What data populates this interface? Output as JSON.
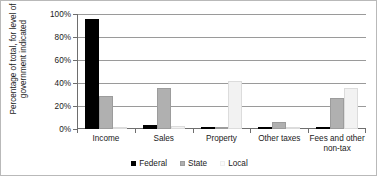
{
  "chart_data": {
    "type": "bar",
    "title": "",
    "xlabel": "",
    "ylabel": "Percentage of total, for level of government indicated",
    "ylim": [
      0,
      100
    ],
    "ytick_labels": [
      "100%",
      "80%",
      "60%",
      "40%",
      "20%",
      "0%"
    ],
    "ytick_values": [
      100,
      80,
      60,
      40,
      20,
      0
    ],
    "grid": true,
    "legend_position": "bottom",
    "categories": [
      "Income",
      "Sales",
      "Property",
      "Other taxes",
      "Fees and other non-tax"
    ],
    "series": [
      {
        "name": "Federal",
        "color": "#000000",
        "values": [
          96,
          3.5,
          0.3,
          0.5,
          2
        ]
      },
      {
        "name": "State",
        "color": "#b0b0b0",
        "values": [
          29,
          36,
          1.5,
          6.5,
          27
        ]
      },
      {
        "name": "Local",
        "color": "#f2f2f2",
        "values": [
          2,
          3,
          42,
          1.5,
          36
        ]
      }
    ]
  },
  "legend": {
    "items": [
      {
        "label": "Federal"
      },
      {
        "label": "State"
      },
      {
        "label": "Local"
      }
    ]
  }
}
